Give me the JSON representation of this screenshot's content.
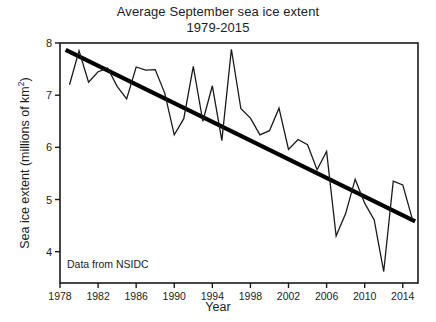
{
  "chart_data": {
    "type": "line",
    "title": "Average September sea ice extent",
    "subtitle": "1979-2015",
    "xlabel": "Year",
    "ylabel": "Sea ice extent (millions of km²)",
    "ylabel_main": "Sea ice extent (millions of km",
    "ylabel_sup": "2",
    "ylabel_tail": ")",
    "annotation": "Data from NSIDC",
    "xlim": [
      1978,
      2015.6
    ],
    "ylim": [
      3.4,
      8.0
    ],
    "grid": false,
    "legend": "none",
    "xticks": [
      1978,
      1982,
      1986,
      1990,
      1994,
      1998,
      2002,
      2006,
      2010,
      2014
    ],
    "xtick_labels": [
      "1978",
      "1982",
      "1986",
      "1990",
      "1994",
      "1998",
      "2002",
      "2006",
      "2010",
      "2014"
    ],
    "yticks": [
      4,
      5,
      6,
      7,
      8
    ],
    "ytick_labels": [
      "4",
      "5",
      "6",
      "7",
      "8"
    ],
    "x": [
      1979,
      1980,
      1981,
      1982,
      1983,
      1984,
      1985,
      1986,
      1987,
      1988,
      1989,
      1990,
      1991,
      1992,
      1993,
      1994,
      1995,
      1996,
      1997,
      1998,
      1999,
      2000,
      2001,
      2002,
      2003,
      2004,
      2005,
      2006,
      2007,
      2008,
      2009,
      2010,
      2011,
      2012,
      2013,
      2014,
      2015
    ],
    "series": [
      {
        "name": "September sea ice extent",
        "color": "#1a1a1a",
        "width": 1.3,
        "values": [
          7.2,
          7.85,
          7.25,
          7.45,
          7.52,
          7.17,
          6.93,
          7.54,
          7.48,
          7.49,
          7.04,
          6.24,
          6.55,
          7.55,
          6.5,
          7.18,
          6.13,
          7.88,
          6.74,
          6.56,
          6.24,
          6.32,
          6.75,
          5.96,
          6.15,
          6.05,
          5.57,
          5.92,
          4.3,
          4.73,
          5.39,
          4.93,
          4.61,
          3.62,
          5.35,
          5.28,
          4.63
        ]
      }
    ],
    "trend": {
      "name": "Linear trend",
      "color": "#000000",
      "width": 4.2,
      "x": [
        1978.6,
        2015.3
      ],
      "y": [
        7.87,
        4.58
      ]
    }
  }
}
